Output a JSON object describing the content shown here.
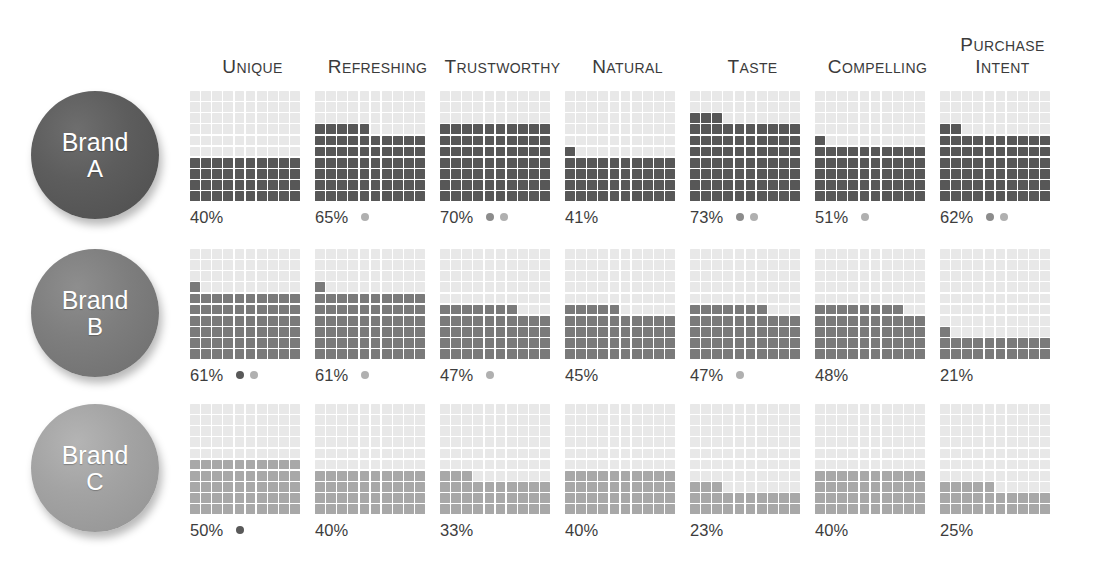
{
  "chart_data": {
    "type": "waffle",
    "title": "",
    "categories": [
      "Unique",
      "Refreshing",
      "Trustworthy",
      "Natural",
      "Taste",
      "Compelling",
      "Purchase Intent"
    ],
    "grid": {
      "rows": 10,
      "cols": 10,
      "unit_value": 1,
      "fill_order": "bottom-up-left-to-right"
    },
    "ylim": [
      0,
      100
    ],
    "series": [
      {
        "name": "Brand A",
        "values": [
          40,
          65,
          70,
          41,
          73,
          51,
          62
        ]
      },
      {
        "name": "Brand B",
        "values": [
          61,
          61,
          47,
          45,
          47,
          48,
          21
        ]
      },
      {
        "name": "Brand C",
        "values": [
          50,
          40,
          33,
          40,
          23,
          40,
          25
        ]
      }
    ],
    "significance_markers": {
      "Brand A": [
        [],
        [
          "c"
        ],
        [
          "b",
          "c"
        ],
        [],
        [
          "b",
          "c"
        ],
        [
          "c"
        ],
        [
          "b",
          "c"
        ]
      ],
      "Brand B": [
        [
          "a",
          "c"
        ],
        [
          "c"
        ],
        [
          "c"
        ],
        [],
        [
          "c"
        ],
        [],
        []
      ],
      "Brand C": [
        [
          "a"
        ],
        [],
        [],
        [],
        [],
        [],
        []
      ]
    }
  },
  "header": {
    "columns": [
      {
        "first": "U",
        "rest": "NIQUE",
        "line2_first": "",
        "line2_rest": ""
      },
      {
        "first": "R",
        "rest": "EFRESHING",
        "line2_first": "",
        "line2_rest": ""
      },
      {
        "first": "T",
        "rest": "RUSTWORTHY",
        "line2_first": "",
        "line2_rest": ""
      },
      {
        "first": "N",
        "rest": "ATURAL",
        "line2_first": "",
        "line2_rest": ""
      },
      {
        "first": "T",
        "rest": "ASTE",
        "line2_first": "",
        "line2_rest": ""
      },
      {
        "first": "C",
        "rest": "OMPELLING",
        "line2_first": "",
        "line2_rest": ""
      },
      {
        "first": "P",
        "rest": "URCHASE",
        "line2_first": "I",
        "line2_rest": "NTENT"
      }
    ]
  },
  "rows": [
    {
      "brand_line1": "Brand",
      "brand_line2": "A",
      "fill_class": "fill-a",
      "circle_class": "c-a",
      "color": "#575757",
      "cells": [
        {
          "pct_label": "40%",
          "value": 40,
          "dots": []
        },
        {
          "pct_label": "65%",
          "value": 65,
          "dots": [
            "d-c"
          ]
        },
        {
          "pct_label": "70%",
          "value": 70,
          "dots": [
            "d-b",
            "d-c"
          ]
        },
        {
          "pct_label": "41%",
          "value": 41,
          "dots": []
        },
        {
          "pct_label": "73%",
          "value": 73,
          "dots": [
            "d-b",
            "d-c"
          ]
        },
        {
          "pct_label": "51%",
          "value": 51,
          "dots": [
            "d-c"
          ]
        },
        {
          "pct_label": "62%",
          "value": 62,
          "dots": [
            "d-b",
            "d-c"
          ]
        }
      ]
    },
    {
      "brand_line1": "Brand",
      "brand_line2": "B",
      "fill_class": "fill-b",
      "circle_class": "c-b",
      "color": "#7a7a7a",
      "cells": [
        {
          "pct_label": "61%",
          "value": 61,
          "dots": [
            "d-a",
            "d-c"
          ]
        },
        {
          "pct_label": "61%",
          "value": 61,
          "dots": [
            "d-c"
          ]
        },
        {
          "pct_label": "47%",
          "value": 47,
          "dots": [
            "d-c"
          ]
        },
        {
          "pct_label": "45%",
          "value": 45,
          "dots": []
        },
        {
          "pct_label": "47%",
          "value": 47,
          "dots": [
            "d-c"
          ]
        },
        {
          "pct_label": "48%",
          "value": 48,
          "dots": []
        },
        {
          "pct_label": "21%",
          "value": 21,
          "dots": []
        }
      ]
    },
    {
      "brand_line1": "Brand",
      "brand_line2": "C",
      "fill_class": "fill-c",
      "circle_class": "c-c",
      "color": "#a8a8a8",
      "cells": [
        {
          "pct_label": "50%",
          "value": 50,
          "dots": [
            "d-a"
          ]
        },
        {
          "pct_label": "40%",
          "value": 40,
          "dots": []
        },
        {
          "pct_label": "33%",
          "value": 33,
          "dots": []
        },
        {
          "pct_label": "40%",
          "value": 40,
          "dots": []
        },
        {
          "pct_label": "23%",
          "value": 23,
          "dots": []
        },
        {
          "pct_label": "40%",
          "value": 40,
          "dots": []
        },
        {
          "pct_label": "25%",
          "value": 25,
          "dots": []
        }
      ]
    }
  ]
}
